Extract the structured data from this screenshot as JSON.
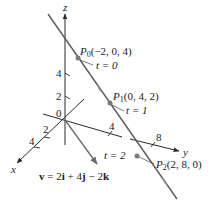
{
  "diagram": {
    "colors": {
      "axis": "#2a2a2a",
      "line": "#5a5a5a",
      "vector": "#6a6a6a",
      "point": "#7a7a7a",
      "text": "#222222"
    },
    "axes": {
      "x_label": "x",
      "y_label": "y",
      "z_label": "z",
      "origin_label": "0",
      "x_ticks": [
        "2",
        "4"
      ],
      "y_ticks": [
        "4",
        "8"
      ],
      "z_ticks": [
        "2",
        "4"
      ]
    },
    "points": [
      {
        "name": "P",
        "sub": "0",
        "coords": "(−2, 0, 4)",
        "t_label": "t = 0"
      },
      {
        "name": "P",
        "sub": "1",
        "coords": "(0, 4, 2)",
        "t_label": "t = 1"
      },
      {
        "name": "P",
        "sub": "2",
        "coords": "(2, 8, 0)",
        "t_label": "t = 2"
      }
    ],
    "vector_label": {
      "v": "v",
      "eq": " = 2",
      "i": "i",
      "plus": " + 4",
      "j": "j",
      "minus": " − 2",
      "k": "k"
    }
  }
}
